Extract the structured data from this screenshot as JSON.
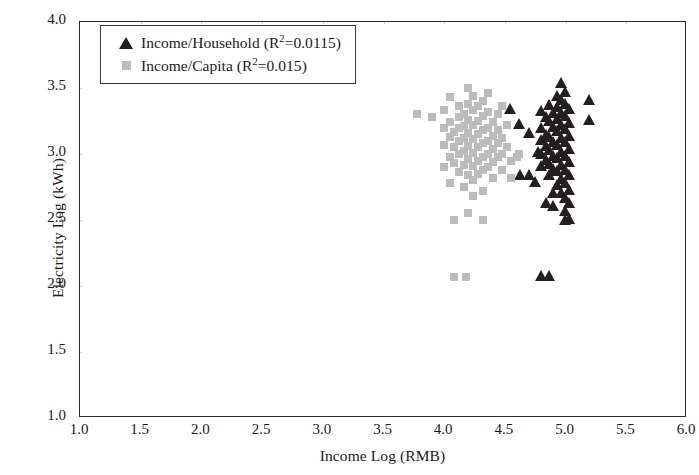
{
  "chart_data": {
    "type": "scatter",
    "title": "",
    "xlabel": "Income Log (RMB)",
    "ylabel": "Electricity Log (kWh)",
    "xlim": [
      1.0,
      6.0
    ],
    "ylim": [
      1.0,
      4.0
    ],
    "xticks": [
      "1.0",
      "1.5",
      "2.0",
      "2.5",
      "3.0",
      "3.5",
      "4.0",
      "4.5",
      "5.0",
      "5.5",
      "6.0"
    ],
    "yticks": [
      "1.0",
      "1.5",
      "2.0",
      "2.5",
      "3.0",
      "3.5",
      "4.0"
    ],
    "grid": true,
    "legend_position": "top-left",
    "series": [
      {
        "name": "Income/Household (R²=0.0115)",
        "label_main": "Income/Household (R",
        "label_sup": "2",
        "label_tail": "=0.0115)",
        "marker": "triangle",
        "color": "#231f20",
        "r_squared": 0.0115,
        "points": [
          [
            4.55,
            3.33
          ],
          [
            4.62,
            3.22
          ],
          [
            4.7,
            3.15
          ],
          [
            4.78,
            3.01
          ],
          [
            4.8,
            3.32
          ],
          [
            4.8,
            3.19
          ],
          [
            4.8,
            3.1
          ],
          [
            4.8,
            2.99
          ],
          [
            4.8,
            2.9
          ],
          [
            4.84,
            3.27
          ],
          [
            4.84,
            3.14
          ],
          [
            4.84,
            3.05
          ],
          [
            4.84,
            2.95
          ],
          [
            4.87,
            3.36
          ],
          [
            4.87,
            3.24
          ],
          [
            4.87,
            3.12
          ],
          [
            4.87,
            3.02
          ],
          [
            4.87,
            2.92
          ],
          [
            4.87,
            2.83
          ],
          [
            4.9,
            3.3
          ],
          [
            4.9,
            3.2
          ],
          [
            4.9,
            3.08
          ],
          [
            4.9,
            2.98
          ],
          [
            4.9,
            2.88
          ],
          [
            4.93,
            3.43
          ],
          [
            4.93,
            3.35
          ],
          [
            4.93,
            3.26
          ],
          [
            4.93,
            3.17
          ],
          [
            4.93,
            3.06
          ],
          [
            4.93,
            2.96
          ],
          [
            4.93,
            2.86
          ],
          [
            4.93,
            2.76
          ],
          [
            4.97,
            3.53
          ],
          [
            4.97,
            3.4
          ],
          [
            4.97,
            3.3
          ],
          [
            4.97,
            3.21
          ],
          [
            4.97,
            3.11
          ],
          [
            4.97,
            3.01
          ],
          [
            4.97,
            2.91
          ],
          [
            4.97,
            2.8
          ],
          [
            4.97,
            2.7
          ],
          [
            5.0,
            3.46
          ],
          [
            5.0,
            3.37
          ],
          [
            5.0,
            3.28
          ],
          [
            5.0,
            3.18
          ],
          [
            5.0,
            3.08
          ],
          [
            5.0,
            2.98
          ],
          [
            5.0,
            2.87
          ],
          [
            5.0,
            2.77
          ],
          [
            5.0,
            2.66
          ],
          [
            5.0,
            2.56
          ],
          [
            5.0,
            2.49
          ],
          [
            5.03,
            3.33
          ],
          [
            5.03,
            3.23
          ],
          [
            5.03,
            3.13
          ],
          [
            5.03,
            3.03
          ],
          [
            5.03,
            2.93
          ],
          [
            5.03,
            2.83
          ],
          [
            5.03,
            2.72
          ],
          [
            5.03,
            2.62
          ],
          [
            5.03,
            2.5
          ],
          [
            5.2,
            3.4
          ],
          [
            5.2,
            3.25
          ],
          [
            4.63,
            2.83
          ],
          [
            4.7,
            2.83
          ],
          [
            4.8,
            2.07
          ],
          [
            4.87,
            2.07
          ],
          [
            4.9,
            2.6
          ],
          [
            4.84,
            2.62
          ],
          [
            4.75,
            2.78
          ],
          [
            4.9,
            2.7
          ]
        ]
      },
      {
        "name": "Income/Capita (R²=0.015)",
        "label_main": "Income/Capita (R",
        "label_sup": "2",
        "label_tail": "=0.015)",
        "marker": "square",
        "color": "#bcbcbc",
        "r_squared": 0.015,
        "points": [
          [
            3.78,
            3.3
          ],
          [
            4.0,
            3.33
          ],
          [
            4.0,
            3.07
          ],
          [
            4.0,
            2.9
          ],
          [
            4.05,
            3.43
          ],
          [
            4.05,
            3.24
          ],
          [
            4.05,
            3.13
          ],
          [
            4.05,
            2.98
          ],
          [
            4.05,
            2.78
          ],
          [
            4.08,
            3.17
          ],
          [
            4.08,
            3.05
          ],
          [
            4.08,
            2.93
          ],
          [
            4.08,
            2.5
          ],
          [
            4.08,
            2.07
          ],
          [
            4.12,
            3.36
          ],
          [
            4.12,
            3.28
          ],
          [
            4.12,
            3.2
          ],
          [
            4.12,
            3.1
          ],
          [
            4.12,
            3.0
          ],
          [
            4.12,
            2.86
          ],
          [
            4.16,
            3.3
          ],
          [
            4.16,
            3.21
          ],
          [
            4.16,
            3.12
          ],
          [
            4.16,
            3.02
          ],
          [
            4.16,
            2.92
          ],
          [
            4.16,
            2.75
          ],
          [
            4.18,
            2.07
          ],
          [
            4.2,
            3.5
          ],
          [
            4.2,
            3.38
          ],
          [
            4.2,
            3.26
          ],
          [
            4.2,
            3.16
          ],
          [
            4.2,
            3.06
          ],
          [
            4.2,
            2.96
          ],
          [
            4.2,
            2.84
          ],
          [
            4.2,
            2.55
          ],
          [
            4.24,
            3.44
          ],
          [
            4.24,
            3.33
          ],
          [
            4.24,
            3.22
          ],
          [
            4.24,
            3.11
          ],
          [
            4.24,
            3.01
          ],
          [
            4.24,
            2.91
          ],
          [
            4.24,
            2.8
          ],
          [
            4.24,
            2.68
          ],
          [
            4.28,
            3.36
          ],
          [
            4.28,
            3.25
          ],
          [
            4.28,
            3.15
          ],
          [
            4.28,
            3.05
          ],
          [
            4.28,
            2.95
          ],
          [
            4.28,
            2.85
          ],
          [
            4.32,
            3.4
          ],
          [
            4.32,
            3.29
          ],
          [
            4.32,
            3.18
          ],
          [
            4.32,
            3.08
          ],
          [
            4.32,
            2.98
          ],
          [
            4.32,
            2.88
          ],
          [
            4.32,
            2.72
          ],
          [
            4.32,
            2.5
          ],
          [
            4.36,
            3.46
          ],
          [
            4.36,
            3.32
          ],
          [
            4.36,
            3.2
          ],
          [
            4.36,
            3.1
          ],
          [
            4.36,
            3.0
          ],
          [
            4.36,
            2.9
          ],
          [
            4.4,
            3.24
          ],
          [
            4.4,
            3.14
          ],
          [
            4.4,
            3.04
          ],
          [
            4.4,
            2.94
          ],
          [
            4.4,
            2.82
          ],
          [
            4.44,
            3.3
          ],
          [
            4.44,
            3.18
          ],
          [
            4.44,
            3.08
          ],
          [
            4.44,
            2.98
          ],
          [
            4.48,
            3.36
          ],
          [
            4.48,
            3.12
          ],
          [
            4.48,
            3.0
          ],
          [
            4.48,
            2.88
          ],
          [
            4.52,
            3.22
          ],
          [
            4.52,
            3.05
          ],
          [
            4.55,
            2.95
          ],
          [
            4.55,
            2.82
          ],
          [
            4.6,
            2.98
          ],
          [
            3.9,
            3.28
          ],
          [
            4.0,
            3.2
          ],
          [
            4.62,
            3.0
          ]
        ]
      }
    ]
  }
}
